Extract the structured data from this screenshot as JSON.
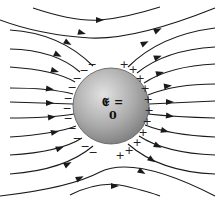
{
  "diagram": {
    "sphere_label": "𝕰 = 0",
    "sphere": {
      "cx": 111,
      "cy": 106,
      "r": 38,
      "fill_light": "#dcdcdc",
      "fill_dark": "#8a8a8a"
    },
    "negative_charge_symbol": "−",
    "positive_charge_symbol": "+",
    "field_line_color": "#1a1a1a",
    "field_direction": "left-to-right",
    "field_lines": [
      {
        "id": "l1",
        "d": "M33 8 Q75 22 100 20 Q125 18 160 7"
      },
      {
        "id": "l2",
        "d": "M0 20 Q40 35 90 38 Q135 40 215 8"
      },
      {
        "id": "l3",
        "d": "M10 30 Q60 33 93 66"
      },
      {
        "id": "l4",
        "d": "M10 49 Q55 50 80 72"
      },
      {
        "id": "l5",
        "d": "M10 67 Q55 70 75 82"
      },
      {
        "id": "l6",
        "d": "M10 88 Q50 88 73 94"
      },
      {
        "id": "l7",
        "d": "M10 102 L73 104"
      },
      {
        "id": "l8",
        "d": "M10 118 Q50 118 74 114"
      },
      {
        "id": "l9",
        "d": "M10 137 Q55 134 76 126"
      },
      {
        "id": "l10",
        "d": "M10 155 Q60 152 82 138"
      },
      {
        "id": "l11",
        "d": "M10 174 Q65 170 93 146"
      },
      {
        "id": "l12",
        "d": "M0 196 Q70 188 100 172 Q135 155 215 196"
      },
      {
        "id": "l13",
        "d": "M70 195 Q100 180 125 186 Q150 192 160 196"
      },
      {
        "id": "r3",
        "d": "M128 67 Q160 35 215 28"
      },
      {
        "id": "r4",
        "d": "M137 73 Q165 50 215 47"
      },
      {
        "id": "r5",
        "d": "M144 83 Q170 66 215 64"
      },
      {
        "id": "r6",
        "d": "M148 95 Q175 84 215 84"
      },
      {
        "id": "r7",
        "d": "M149 104 L215 101"
      },
      {
        "id": "r8",
        "d": "M148 114 Q175 117 215 118"
      },
      {
        "id": "r9",
        "d": "M145 125 Q170 135 215 137"
      },
      {
        "id": "r10",
        "d": "M139 136 Q165 153 215 155"
      },
      {
        "id": "r11",
        "d": "M128 144 Q160 172 215 174"
      }
    ],
    "arrows": [
      {
        "x": 100,
        "y": 20,
        "angle": 0
      },
      {
        "x": 82,
        "y": 33,
        "angle": 15
      },
      {
        "x": 158,
        "y": 30,
        "angle": -25
      },
      {
        "x": 68,
        "y": 43,
        "angle": 30
      },
      {
        "x": 58,
        "y": 55,
        "angle": 25
      },
      {
        "x": 55,
        "y": 71,
        "angle": 15
      },
      {
        "x": 50,
        "y": 89,
        "angle": 8
      },
      {
        "x": 50,
        "y": 103,
        "angle": 0
      },
      {
        "x": 52,
        "y": 117,
        "angle": -6
      },
      {
        "x": 55,
        "y": 132,
        "angle": -12
      },
      {
        "x": 60,
        "y": 148,
        "angle": -20
      },
      {
        "x": 68,
        "y": 164,
        "angle": -28
      },
      {
        "x": 80,
        "y": 178,
        "angle": -25
      },
      {
        "x": 115,
        "y": 186,
        "angle": 0
      },
      {
        "x": 145,
        "y": 43,
        "angle": -25
      },
      {
        "x": 158,
        "y": 57,
        "angle": -20
      },
      {
        "x": 160,
        "y": 73,
        "angle": -15
      },
      {
        "x": 168,
        "y": 86,
        "angle": -8
      },
      {
        "x": 170,
        "y": 102,
        "angle": 0
      },
      {
        "x": 170,
        "y": 116,
        "angle": 6
      },
      {
        "x": 165,
        "y": 131,
        "angle": 15
      },
      {
        "x": 158,
        "y": 146,
        "angle": 25
      },
      {
        "x": 152,
        "y": 160,
        "angle": 35
      },
      {
        "x": 142,
        "y": 172,
        "angle": 30
      }
    ],
    "negative_charges": [
      {
        "x": 92,
        "y": 64
      },
      {
        "x": 84,
        "y": 70
      },
      {
        "x": 77,
        "y": 78
      },
      {
        "x": 72,
        "y": 87
      },
      {
        "x": 68,
        "y": 98
      },
      {
        "x": 67,
        "y": 108
      },
      {
        "x": 68,
        "y": 118
      },
      {
        "x": 72,
        "y": 128
      },
      {
        "x": 77,
        "y": 138
      },
      {
        "x": 85,
        "y": 146
      },
      {
        "x": 93,
        "y": 152
      }
    ],
    "positive_charges": [
      {
        "x": 124,
        "y": 64
      },
      {
        "x": 133,
        "y": 69
      },
      {
        "x": 140,
        "y": 78
      },
      {
        "x": 145,
        "y": 88
      },
      {
        "x": 148,
        "y": 99
      },
      {
        "x": 149,
        "y": 110
      },
      {
        "x": 147,
        "y": 121
      },
      {
        "x": 143,
        "y": 132
      },
      {
        "x": 137,
        "y": 142
      },
      {
        "x": 129,
        "y": 150
      },
      {
        "x": 120,
        "y": 155
      }
    ]
  }
}
